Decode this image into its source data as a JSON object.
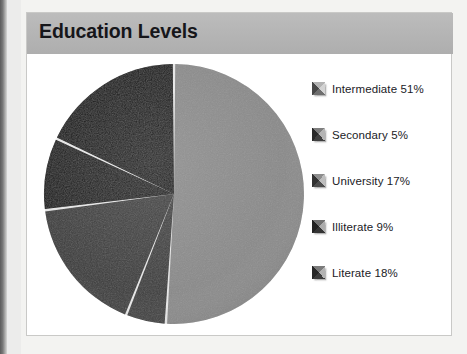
{
  "figure": {
    "title": "Education Levels",
    "panel_bg": "#ffffff",
    "title_band_color": "#b4b4b4",
    "border_color": "#c9c9c7"
  },
  "chart_data": {
    "type": "pie",
    "title": "Education Levels",
    "xlabel": "",
    "ylabel": "",
    "legend_position": "right",
    "grid": false,
    "units": "percent",
    "total": 100,
    "categories": [
      "Intermediate",
      "Secondary",
      "University",
      "Illiterate",
      "Literate"
    ],
    "values": [
      51,
      5,
      17,
      9,
      18
    ],
    "labels": [
      "Intermediate 51%",
      "Secondary 5%",
      "University 17%",
      "Illiterate 9%",
      "Literate 18%"
    ],
    "slice_colors": [
      "#8a8a8a",
      "#3c3c3c",
      "#3a3a3a",
      "#121212",
      "#0d0d0d"
    ],
    "slice_separator_color": "#e8e8e8",
    "start_angle_deg": 0,
    "direction": "clockwise"
  },
  "legend": {
    "items": [
      {
        "label": "Intermediate 51%",
        "name": "Intermediate",
        "value": 51,
        "swatch": "#9e9e9e",
        "swatch_icon": "bevel-square-icon"
      },
      {
        "label": "Secondary 5%",
        "name": "Secondary",
        "value": 5,
        "swatch": "#5a5a5a",
        "swatch_icon": "bevel-square-icon"
      },
      {
        "label": "University 17%",
        "name": "University",
        "value": 17,
        "swatch": "#6e6e6e",
        "swatch_icon": "bevel-square-icon"
      },
      {
        "label": "Illiterate 9%",
        "name": "Illiterate",
        "value": 9,
        "swatch": "#4a4a4a",
        "swatch_icon": "bevel-square-icon"
      },
      {
        "label": "Literate 18%",
        "name": "Literate",
        "value": 18,
        "swatch": "#565656",
        "swatch_icon": "bevel-square-icon"
      }
    ]
  }
}
